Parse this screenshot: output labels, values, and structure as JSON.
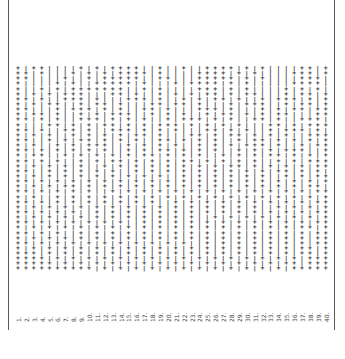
{
  "document": {
    "symbols": {
      "plus": "+",
      "bar": "|"
    },
    "column_labels": [
      "1.",
      "2.",
      "3.",
      "4.",
      "5.",
      "6.",
      "7.",
      "8.",
      "9.",
      "10.",
      "11.",
      "12.",
      "13.",
      "14.",
      "15.",
      "16.",
      "17.",
      "18.",
      "19.",
      "20.",
      "21.",
      "22.",
      "23.",
      "24.",
      "25.",
      "26.",
      "27.",
      "28.",
      "29.",
      "30.",
      "31.",
      "32.",
      "33.",
      "34.",
      "35.",
      "36.",
      "37.",
      "38.",
      "39.",
      "40."
    ],
    "rows": [
      "+|++||||+|+|++++||+||+||++++|+|+||||++|+",
      "++|+|||+|+|+|++++|+||||++++|+|+||||+++|+",
      "++||||+||+|+++++||++|||+++++|+|+||||+++|+",
      "+||||+|+||+++++|+|||+|++++|+|+|||||++++||",
      "+||+|+|+++++++||+|+||||+++|+|+||||+|+|+|+|",
      "+|+|+|+++|||++|+||+|+|+|++|+|++|||+|++|+",
      "++|+||+++|+|||+++|+||+|+|++|+||+|+++|+|+",
      "+|+|++||+|++|+|||++|++|+|||+|+++||+|++|+",
      "++|||+|+++|+|+||++|+|||+++|+|||+|+|++|++",
      "+|++|+||+|+|+++||+|+|+||+|++|+|+|++|||++",
      "++|+|+||+++|+|+|+||+|+++|+|+||++|+||+++|",
      "+|||++|+|+|++|+|+|+++|+|+|+|+|||++|+|+++",
      "++|+||++|+||+++|+|+|+|||++|+|+||+|+++|+|",
      "+|+|+||+|+|+|+|++|+|||++|+|++|+|+|+||+++",
      "++||+|+|++|+|+|+||++|+|+|+||+|++|+|+|+|+",
      "+|+||+|+|+++||+|+|+|+||+|+|+|+++|+||+|++",
      "++|+|+|+|+|+||+|+|++|+|+|+||+|+|+|+++||+",
      "+|++||+|+|+|+|+|++|+|+|+||+|+|+|++|+|+|+",
      "++|+|+||+|+|++|+|+|+|++|+|+|+|+||+|+|+++",
      "+|+|+|+|+||+|+|+|+|+|+|+|+|++|+|+|+|+|++",
      "++||+|+|+|+|+||+|+|+|+|+|+|+|+|+|++|+|+|",
      "+|+|+|+|+|+|+|+|+|+||+|+|+|+|+|+||+|+|++",
      "++|+|+|+|+|+|+|+|+|+|+|+|+|+|+|+|+|+|+|+",
      "+|+|+|++|+|+|+|+|+|+|+|+|+|+|+|+|+|+|++|",
      "++|+|+|+|+||+|+|+|+|+|+|+|+|+|+|+|+|+|++",
      "+|+||+|+|+|+|+|+|+|+|+|+|+|+|+|+|+|+|+|+",
      "++|+|+|+|+|+|+|+|+||+|+|+|+|+|+|+|+|+|++",
      "+|+|+|+|+|+|+|+|+|+|+|+|+|+|+|+||+|+|+|+",
      "++|+|+|+||+|+|+|+|+|+|+|+|+|+|+|+|+|+|++",
      "+|+|+|+|+|+|+|+|+|+|+|+||+|+|+|+|+|+|+|+",
      "++|+|+|+|+|+|+||+|+|+|+|+|+|+|+|+|+|+|++",
      "+|+|+|+|+|+|+|+|+|+|+|+|+|+|+|+|+|+|++|+",
      "++|+|+||+|+|+|+|+|+|+|+|+|+|+|+|+|+|+|++",
      "+|+|+|+|+|+|+|+|+|+|+|+|+|+|+|+|+|+|+|++",
      "++|+|+|+|+|+|+|+|+|+|+||+|+|+|+|+|+|+|++",
      "+|+|+|+|+|+|+|+|+|+|+|+|+|+|+|+|+|+|++|+",
      "+++|+|+|+|+|+|+|+|+|+|+|+|+|+|+|+|+|++|+",
      "++++|+|+|+|+|+|+|+|+|+|+|+|+|+|+|+|+|+++",
      "+++++|+|+|+|+|+|+|+|+|+|+|+|+|+|+|++|+++",
      "++++++++++|+|+|+|+|+|+|+|+|+|+|+|+|+++++"
    ]
  }
}
